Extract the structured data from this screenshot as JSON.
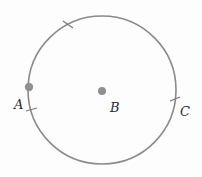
{
  "diagram": {
    "type": "geometry-circle",
    "circle": {
      "cx": 102,
      "cy": 90,
      "r": 73,
      "stroke": "#8a8a8a"
    },
    "points": [
      {
        "id": "A",
        "label": "A",
        "x": 29,
        "y": 87,
        "label_x": 15,
        "label_y": 108,
        "color": "#909090"
      },
      {
        "id": "B",
        "label": "B",
        "x": 102,
        "y": 91,
        "label_x": 110,
        "label_y": 112,
        "color": "#909090"
      },
      {
        "id": "C",
        "label": "C",
        "label_x": 180,
        "label_y": 116
      }
    ],
    "tick_marks": [
      {
        "x": 68,
        "y": 25,
        "angle": -32
      },
      {
        "x": 31,
        "y": 110,
        "angle": 10
      },
      {
        "x": 174,
        "y": 99,
        "angle": -10
      }
    ]
  }
}
